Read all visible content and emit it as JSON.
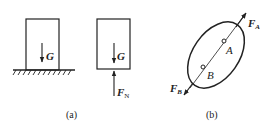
{
  "figure_a": {
    "caption": "(a)",
    "block_on_ground": {
      "force_label": "G"
    },
    "free_body": {
      "weight_label": "G",
      "normal_label": "F",
      "normal_sub": "N"
    }
  },
  "figure_b": {
    "caption": "(b)",
    "point_a": "A",
    "point_b": "B",
    "force_a_label": "F",
    "force_a_sub": "A",
    "force_b_label": "F",
    "force_b_sub": "B"
  },
  "colors": {
    "stroke": "#222222",
    "background": "#ffffff"
  }
}
